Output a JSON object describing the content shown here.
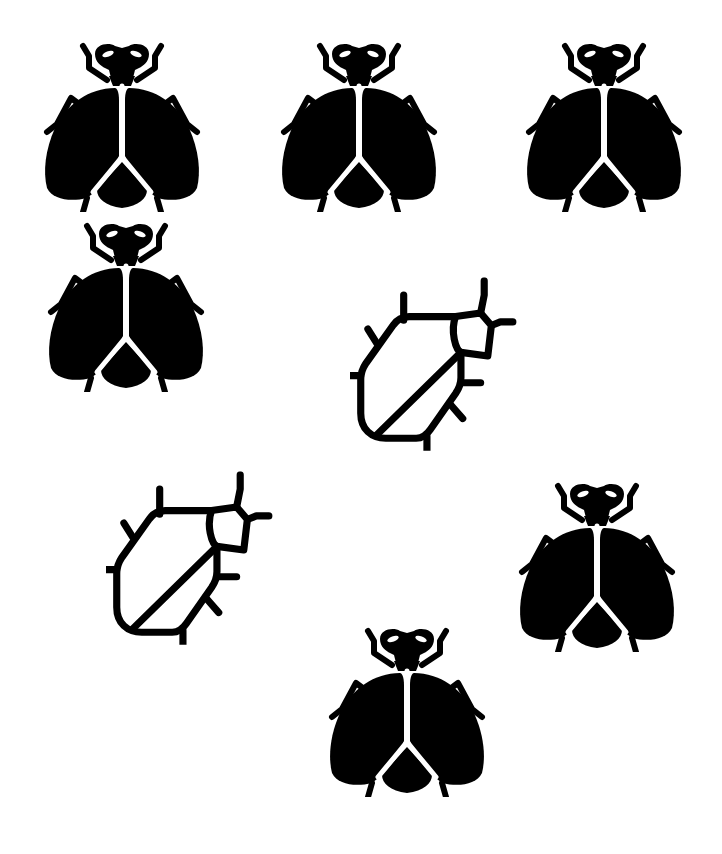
{
  "canvas": {
    "width": 722,
    "height": 854,
    "background": "#ffffff",
    "ink": "#000000"
  },
  "icons": [
    {
      "id": "fly-1",
      "type": "fly-icon",
      "style": "filled",
      "x": 43,
      "y": 40,
      "w": 158,
      "h": 172
    },
    {
      "id": "fly-2",
      "type": "fly-icon",
      "style": "filled",
      "x": 280,
      "y": 40,
      "w": 158,
      "h": 172
    },
    {
      "id": "fly-3",
      "type": "fly-icon",
      "style": "filled",
      "x": 525,
      "y": 40,
      "w": 158,
      "h": 172
    },
    {
      "id": "fly-4",
      "type": "fly-icon",
      "style": "filled",
      "x": 47,
      "y": 220,
      "w": 158,
      "h": 172
    },
    {
      "id": "beetle-1",
      "type": "beetle-icon",
      "style": "outline",
      "x": 336,
      "y": 268,
      "w": 190,
      "h": 194
    },
    {
      "id": "beetle-2",
      "type": "beetle-icon",
      "style": "outline",
      "x": 92,
      "y": 462,
      "w": 190,
      "h": 194
    },
    {
      "id": "fly-5",
      "type": "fly-icon",
      "style": "filled",
      "x": 518,
      "y": 480,
      "w": 158,
      "h": 172
    },
    {
      "id": "fly-6",
      "type": "fly-icon",
      "style": "filled",
      "x": 328,
      "y": 625,
      "w": 158,
      "h": 172
    }
  ],
  "summary": {
    "fly_count": 6,
    "beetle_count": 2
  }
}
